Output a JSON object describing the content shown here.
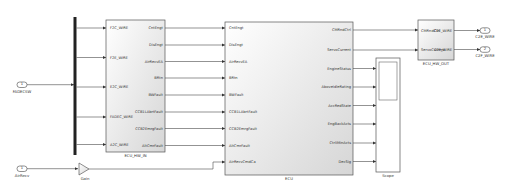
{
  "diagram": {
    "inports": [
      {
        "id": "FADECSW",
        "number": "1",
        "label": "FADECSW"
      },
      {
        "id": "AirRecv",
        "number": "1",
        "label": "AirRecv"
      }
    ],
    "outports": [
      {
        "id": "C2E_WIRE",
        "number": "1",
        "label": "C2E_WIRE"
      },
      {
        "id": "C2F_WIRE",
        "number": "2",
        "label": "C2F_WIRE"
      }
    ],
    "gain": {
      "label": "Gain"
    },
    "ecu_hw_in": {
      "name": "ECU_HW_IN",
      "inputs": [
        "F2C_WIRE",
        "F2E_WIRE",
        "E2C_WIRE",
        "FADEC_WIRE",
        "A2C_WIRE"
      ],
      "outputs": [
        "CntEngt",
        "DisEngt",
        "AirRecvEA",
        "BRtn",
        "BWFault",
        "CCB1LAbrtFault",
        "CCB2EmrgFault",
        "AltCmrFault"
      ]
    },
    "ecu": {
      "name": "ECU",
      "inputs": [
        "CntEngt",
        "DisEngt",
        "AirRecvEA",
        "BRtn",
        "BWFault",
        "CCB1LAbrtFault",
        "CCB2EmrgFault",
        "AltCmrFault",
        "AirRecvCmdCa"
      ],
      "outputs": [
        "CMRndCtrl",
        "ServoCurrent",
        "EngineStatus",
        "AboveIdleRating",
        "AccRedState",
        "EngBackActs",
        "CtrlIMinActs",
        "DecSig"
      ]
    },
    "scope": {
      "name": "Scope"
    },
    "ecu_hw_out": {
      "name": "ECU_HW_OUT",
      "inputs": [
        "CMRndCtrl",
        "ServoCurrent"
      ],
      "outputs": [
        "C2E_WIRE",
        "C2F_WIRE"
      ]
    },
    "colors": {
      "line": "#4a4a4a",
      "block_border": "#555555",
      "block_fill_top": "#ffffff",
      "block_fill_bottom": "#dcdcdc",
      "bus_bar": "#222222"
    }
  }
}
